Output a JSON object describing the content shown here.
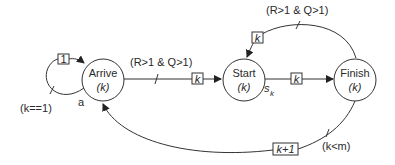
{
  "diagram": {
    "type": "state-transition",
    "nodes": [
      {
        "id": "arrive",
        "label": "Arrive",
        "param": "(k)"
      },
      {
        "id": "start",
        "label": "Start",
        "param": "(k)"
      },
      {
        "id": "finish",
        "label": "Finish",
        "param": "(k)"
      }
    ],
    "edges": [
      {
        "id": "self-loop",
        "from": "arrive",
        "to": "arrive",
        "token": "1",
        "condition": "(k==1)",
        "annotation": "a"
      },
      {
        "id": "arrive-start",
        "from": "arrive",
        "to": "start",
        "token": "k",
        "condition": "(R>1 & Q>1)"
      },
      {
        "id": "start-finish",
        "from": "start",
        "to": "finish",
        "token": "k",
        "annotation": "s",
        "annotation_sub": "k"
      },
      {
        "id": "finish-start",
        "from": "finish",
        "to": "start",
        "token": "k",
        "condition": "(R>1 & Q>1)"
      },
      {
        "id": "finish-arrive",
        "from": "finish",
        "to": "arrive",
        "token": "k+1",
        "condition": "(k<m)"
      }
    ]
  }
}
